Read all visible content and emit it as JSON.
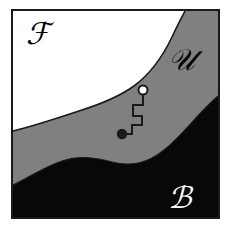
{
  "figure": {
    "frame": {
      "x": 12,
      "y": 10,
      "width": 207,
      "height": 208,
      "stroke_color": "#1a1a1a",
      "stroke_width": 2
    },
    "colors": {
      "foreground_region": "#ffffff",
      "unknown_region": "#808080",
      "background_region": "#080808",
      "outline": "#1a1a1a",
      "label_dark": "#000000",
      "label_light": "#ffffff",
      "page_background": "#ffffff"
    },
    "regions": [
      {
        "name": "foreground",
        "label": "ℱ",
        "label_text": "F",
        "fill": "#ffffff",
        "label_color": "#000000",
        "label_x": 38,
        "label_y": 44,
        "label_size": 30,
        "position": "top-left"
      },
      {
        "name": "unknown",
        "label": "𝒰",
        "label_text": "U",
        "fill": "#808080",
        "label_color": "#000000",
        "label_x": 181,
        "label_y": 70,
        "label_size": 30,
        "position": "upper-right-band"
      },
      {
        "name": "background",
        "label": "ℬ",
        "label_text": "B",
        "fill": "#080808",
        "label_color": "#ffffff",
        "label_x": 180,
        "label_y": 208,
        "label_size": 30,
        "position": "bottom-right"
      }
    ],
    "boundaries": {
      "white_gray_curve": "M 13,131 C 34,126 58,118 82,110 C 104,103 120,96 134,86 C 150,74 163,56 172,37 C 178,24 182,17 185,11",
      "gray_black_curve": "M 13,185 C 30,177 44,167 62,161 C 80,155 96,158 112,162 C 132,167 148,163 164,150 C 182,136 198,113 218,96"
    },
    "path_marker": {
      "name": "staircase-path",
      "stroke_color": "#1a1a1a",
      "stroke_width": 2,
      "fill": "none",
      "points": "M 122,134 L 132,134 L 132,125 L 142,125 L 142,116 L 133,116 L 133,105 L 143,105 L 143,93",
      "start_point": {
        "name": "filled-dot",
        "x": 122,
        "y": 134,
        "radius": 4.5,
        "fill": "#1a1a1a",
        "stroke": "#1a1a1a"
      },
      "end_point": {
        "name": "open-circle",
        "x": 143,
        "y": 90,
        "radius": 4.5,
        "fill": "#ffffff",
        "stroke": "#1a1a1a"
      }
    }
  }
}
